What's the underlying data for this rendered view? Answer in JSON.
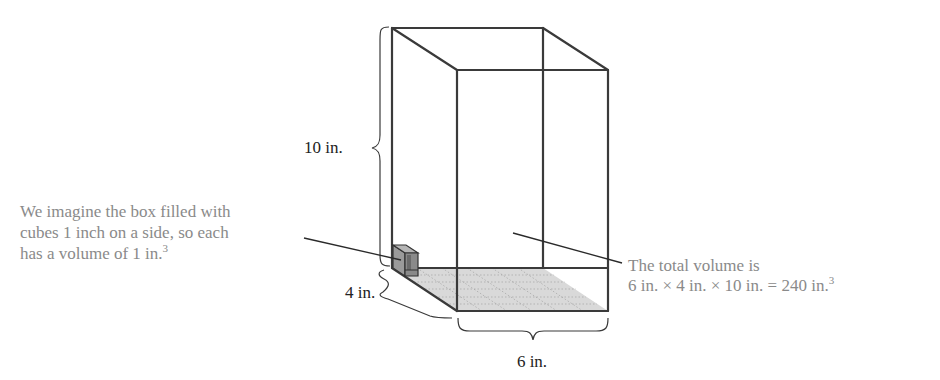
{
  "figure": {
    "dimensions": {
      "height_label": "10 in.",
      "depth_label": "4 in.",
      "width_label": "6 in."
    },
    "annotations": {
      "unit_cube": {
        "lines": [
          "We imagine the box filled with",
          "cubes 1 inch on a side, so each",
          "has a volume of 1 in."
        ],
        "superscript": "3"
      },
      "total_volume": {
        "lines": [
          "The total volume is",
          "6 in. × 4 in. × 10 in. = 240 in."
        ],
        "superscript": "3"
      }
    },
    "colors": {
      "edge": "#3a3a3a",
      "annotation_text": "#8a8a8a",
      "label_text": "#222222",
      "base_fill": "#d9d9d9",
      "cube_side": "#9a9a9a",
      "cube_front": "#7a7a7a"
    }
  }
}
